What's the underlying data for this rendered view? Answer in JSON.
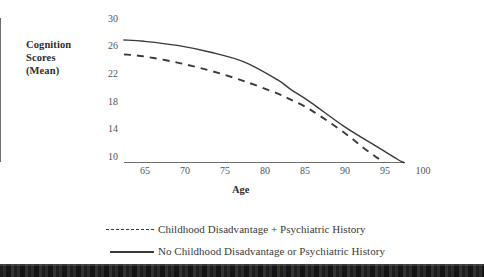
{
  "chart_data": {
    "type": "line",
    "title": "",
    "xlabel": "Age",
    "ylabel": "Cognition Scores (Mean)",
    "ylabel_lines": [
      "Cognition",
      "Scores",
      "(Mean)"
    ],
    "xlim": [
      62,
      104
    ],
    "ylim": [
      9,
      30
    ],
    "xticks": [
      65,
      70,
      75,
      80,
      85,
      90,
      95,
      100
    ],
    "yticks": [
      30,
      26,
      22,
      18,
      14,
      10
    ],
    "grid": false,
    "legend_position": "bottom",
    "series": [
      {
        "name": "Childhood Disadvantage + Psychiatric History",
        "style": "dashed",
        "color": "#3a3a3a",
        "x": [
          62,
          65,
          70,
          75,
          80,
          85,
          87,
          90,
          95,
          98,
          100,
          101
        ],
        "values": [
          24.7,
          24.4,
          23.5,
          22.3,
          20.8,
          19.0,
          18.1,
          16.6,
          13.3,
          11.0,
          9.6,
          8.9
        ]
      },
      {
        "name": "No Childhood Disadvantage or Psychiatric History",
        "style": "solid",
        "color": "#3a3a3a",
        "x": [
          62,
          65,
          70,
          75,
          80,
          85,
          87,
          90,
          95,
          100,
          103,
          104
        ],
        "values": [
          26.8,
          26.6,
          26.0,
          25.0,
          23.6,
          21.0,
          19.6,
          17.7,
          14.2,
          11.2,
          9.4,
          8.9
        ]
      }
    ]
  },
  "axis": {
    "ytick_labels": [
      "30",
      "26",
      "22",
      "18",
      "14",
      "10"
    ],
    "xtick_labels": [
      "65",
      "70",
      "75",
      "80",
      "85",
      "90",
      "95",
      "100"
    ]
  },
  "legend": {
    "items": [
      {
        "label": "Childhood Disadvantage + Psychiatric History",
        "style": "dashed"
      },
      {
        "label": "No Childhood Disadvantage or Psychiatric History",
        "style": "solid"
      }
    ]
  }
}
